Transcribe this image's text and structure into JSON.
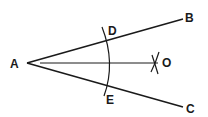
{
  "diagram": {
    "points": {
      "A": {
        "label": "A",
        "x": 27,
        "y": 63
      },
      "B": {
        "label": "B",
        "x": 183,
        "y": 19
      },
      "C": {
        "label": "C",
        "x": 183,
        "y": 107
      },
      "D": {
        "label": "D",
        "x": 107,
        "y": 41
      },
      "E": {
        "label": "E",
        "x": 106,
        "y": 86
      },
      "O": {
        "label": "O",
        "x": 156,
        "y": 63
      }
    },
    "segments": [
      "AB",
      "AC",
      "AO"
    ],
    "arcs": [
      "arc DE centered at A",
      "intersecting arcs at O"
    ],
    "stroke_color": "#1a1a1a"
  }
}
